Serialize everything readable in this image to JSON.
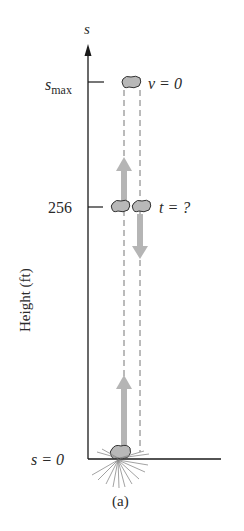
{
  "figure": {
    "caption": "(a)",
    "axis": {
      "name": "s",
      "ylabel": "Height (ft)",
      "ticks": [
        {
          "label_main": "s",
          "label_sub": "max",
          "kind": "smax"
        },
        {
          "label": "256",
          "kind": "value"
        },
        {
          "label": "s = 0",
          "kind": "origin"
        }
      ]
    },
    "annotations": {
      "top": "v = 0",
      "middle": "t = ?"
    },
    "colors": {
      "axis": "#1a1a1a",
      "rock_fill": "#b8b8b8",
      "rock_stroke": "#333333",
      "arrow": "#b5b5b5",
      "dashed": "#777777",
      "burst": "#8a8a8a"
    }
  }
}
